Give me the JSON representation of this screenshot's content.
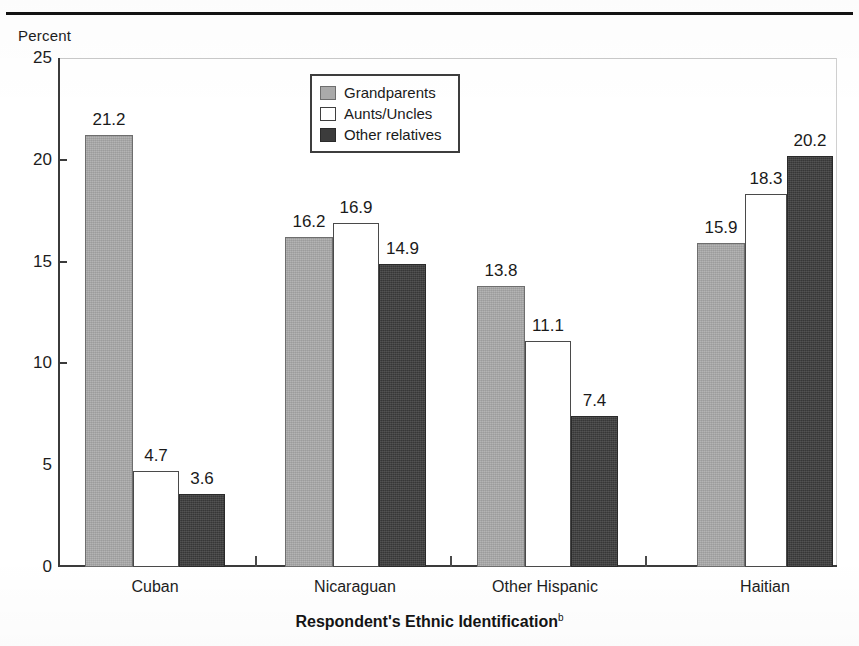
{
  "chart_data": {
    "type": "bar",
    "title": "",
    "subtitle": "",
    "xlabel": "Respondent's Ethnic Identification",
    "xlabel_superscript": "b",
    "ylabel": "Percent",
    "ylim": [
      0,
      25
    ],
    "yticks": [
      0,
      5,
      10,
      15,
      20,
      25
    ],
    "ytick_labels": [
      "0",
      "5",
      "10",
      "15",
      "20",
      "25"
    ],
    "grid": false,
    "legend_position": "top-center",
    "categories": [
      "Cuban",
      "Nicaraguan",
      "Other Hispanic",
      "Haitian"
    ],
    "series": [
      {
        "name": "Grandparents",
        "color": "#aaaaaa",
        "values": [
          21.2,
          16.2,
          13.8,
          15.9
        ],
        "labels": [
          "21.2",
          "16.2",
          "13.8",
          "15.9"
        ]
      },
      {
        "name": "Aunts/Uncles",
        "color": "#ffffff",
        "values": [
          4.7,
          16.9,
          11.1,
          18.3
        ],
        "labels": [
          "4.7",
          "16.9",
          "11.1",
          "18.3"
        ]
      },
      {
        "name": "Other relatives",
        "color": "#3c3c3c",
        "values": [
          3.6,
          14.9,
          7.4,
          20.2
        ],
        "labels": [
          "3.6",
          "14.9",
          "7.4",
          "20.2"
        ]
      }
    ]
  },
  "axis": {
    "y_caption": "Percent",
    "x_title": "Respondent's Ethnic Identification",
    "x_title_note": "b"
  },
  "legend": {
    "items": [
      {
        "label": "Grandparents",
        "swatch": "grandparents-swatch"
      },
      {
        "label": "Aunts/Uncles",
        "swatch": "aunts-uncles-swatch"
      },
      {
        "label": "Other relatives",
        "swatch": "other-relatives-swatch"
      }
    ]
  },
  "colors": {
    "grandparents": "#aaaaaa",
    "aunts_uncles": "#ffffff",
    "other_relatives": "#3c3c3c",
    "axis": "#3b3b3b",
    "text": "#1a1a1a",
    "rule": "#121212"
  }
}
